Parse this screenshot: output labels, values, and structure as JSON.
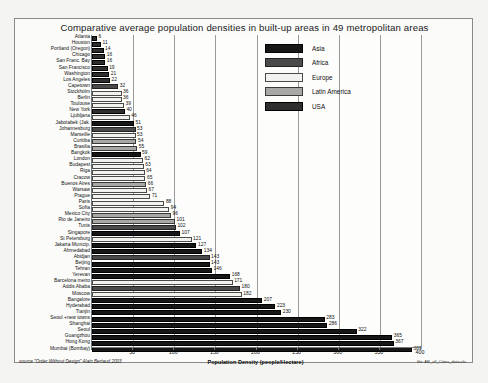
{
  "chart": {
    "title": "Comparative  average population densities in built-up areas in 49 metropolitan areas",
    "xlabel": "Population Density (people/Hectare)",
    "source": "source \"Order Without Design\" Alain Bertaud,2003",
    "file_note": "file: AB_all_Cities_data.xls"
  },
  "legend": {
    "items": [
      {
        "label": "Asia",
        "color": "#161616",
        "key": "asia"
      },
      {
        "label": "Africa",
        "color": "#4a4a4a",
        "key": "africa"
      },
      {
        "label": "Europe",
        "color": "#f2f2ef",
        "key": "europe"
      },
      {
        "label": "Latin America",
        "color": "#a8a8a4",
        "key": "latin"
      },
      {
        "label": "USA",
        "color": "#2e2e2e",
        "key": "usa"
      }
    ]
  },
  "chart_data": {
    "type": "bar",
    "orientation": "horizontal",
    "title": "Comparative  average population densities in built-up areas in 49 metropolitan areas",
    "xlabel": "Population Density (people/Hectare)",
    "ylabel": "",
    "xlim": [
      0,
      400
    ],
    "xticks": [
      0,
      50,
      100,
      150,
      200,
      250,
      300,
      350,
      400
    ],
    "grid": true,
    "legend_position": "top-right",
    "series_groups": [
      "Asia",
      "Africa",
      "Europe",
      "Latin America",
      "USA"
    ],
    "categories": [
      "Atlanta",
      "Houston",
      "Portland (Oregon)",
      "Chicago",
      "San Franc. Bay",
      "San Francisco",
      "Washington",
      "Los Angeles",
      "Capetown",
      "Stockholm",
      "Berlin",
      "Toulouse",
      "New York",
      "Ljubljana",
      "Jabotabek (Jak.",
      "Johannesburg",
      "Marseille",
      "Curitiba",
      "Brasilia",
      "Bangkok",
      "London",
      "Budapest",
      "Riga",
      "Cracow",
      "Buenos Aires",
      "Warsaw",
      "Prague",
      "Paris",
      "Sofia",
      "Mexico City",
      "Rio de Janeiro",
      "Tunis",
      "Singapore",
      "St Petersburg",
      "Jakarta Municip.",
      "Ahmedabad",
      "Abidjan",
      "Beijing",
      "Tehran",
      "Yerevan",
      "Barcelona metro",
      "Addis Ababa",
      "Moscow",
      "Bangalore",
      "Hyderabad",
      "Tianjin",
      "Seoul +new towns",
      "Shanghai",
      "Seoul",
      "Guangzhou",
      "Hong Kong",
      "Mumbai (Bombay)"
    ],
    "values": [
      6,
      11,
      14,
      16,
      16,
      19,
      21,
      22,
      32,
      36,
      36,
      39,
      40,
      46,
      51,
      53,
      53,
      54,
      55,
      59,
      62,
      63,
      64,
      65,
      66,
      67,
      71,
      88,
      94,
      96,
      101,
      102,
      107,
      121,
      127,
      134,
      143,
      143,
      146,
      168,
      171,
      180,
      182,
      207,
      223,
      230,
      283,
      286,
      322,
      365,
      367,
      389
    ],
    "regions": [
      "usa",
      "usa",
      "usa",
      "usa",
      "usa",
      "usa",
      "usa",
      "usa",
      "africa",
      "europe",
      "europe",
      "europe",
      "usa",
      "europe",
      "asia",
      "africa",
      "europe",
      "latin",
      "latin",
      "asia",
      "europe",
      "europe",
      "europe",
      "europe",
      "latin",
      "europe",
      "europe",
      "europe",
      "europe",
      "latin",
      "latin",
      "africa",
      "asia",
      "europe",
      "asia",
      "asia",
      "africa",
      "asia",
      "asia",
      "asia",
      "europe",
      "africa",
      "europe",
      "asia",
      "asia",
      "asia",
      "asia",
      "asia",
      "asia",
      "asia",
      "asia",
      "asia"
    ]
  }
}
